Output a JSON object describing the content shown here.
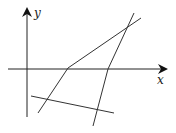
{
  "diagram": {
    "axes": {
      "x_label": "x",
      "y_label": "y",
      "origin": [
        27,
        69
      ],
      "x_axis": {
        "from": [
          8,
          69
        ],
        "to": [
          166,
          69
        ]
      },
      "y_axis": {
        "from": [
          27,
          117
        ],
        "to": [
          27,
          8
        ]
      }
    },
    "polylines": [
      {
        "name": "left-kinked-line",
        "points": "38,113 68,68 141,18"
      },
      {
        "name": "right-kinked-line",
        "points": "93,126 108,69 134,13"
      },
      {
        "name": "bottom-line",
        "points": "31,96 114,113"
      }
    ],
    "colors": {
      "line": "#333333",
      "axis": "#222222"
    }
  }
}
